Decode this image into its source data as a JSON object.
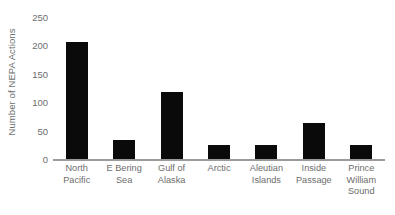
{
  "chart_data": {
    "type": "bar",
    "title": "",
    "subtitle": "",
    "xlabel": "",
    "ylabel": "Number of NEPA Actions",
    "categories": [
      "North Pacific",
      "E Bering Sea",
      "Gulf of Alaska",
      "Arctic",
      "Aleutian Islands",
      "Inside Passage",
      "Prince William Sound"
    ],
    "category_lines": [
      [
        "North",
        "Pacific"
      ],
      [
        "E Bering",
        "Sea"
      ],
      [
        "Gulf of",
        "Alaska"
      ],
      [
        "Arctic"
      ],
      [
        "Aleutian",
        "Islands"
      ],
      [
        "Inside",
        "Passage"
      ],
      [
        "Prince",
        "William",
        "Sound"
      ]
    ],
    "values": [
      208,
      35,
      120,
      27,
      26,
      66,
      27
    ],
    "ylim": [
      0,
      250
    ],
    "yticks": [
      0,
      50,
      100,
      150,
      200,
      250
    ],
    "ytick_labels": [
      "0",
      "50",
      "100",
      "150",
      "200",
      "250"
    ],
    "grid": false,
    "legend": false,
    "legend_position": "none",
    "bar_color": "#0a0a0a",
    "axis_color": "#9b9b9b",
    "text_color": "#6d6d6d",
    "background_color": "#ffffff"
  }
}
